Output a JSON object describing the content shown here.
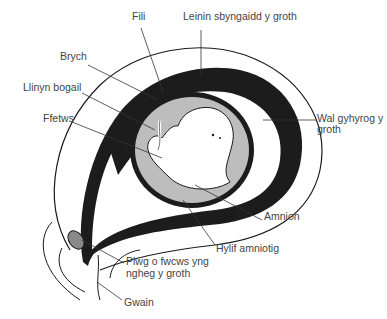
{
  "diagram": {
    "type": "anatomical-illustration",
    "colors": {
      "ink": "#1a1a1a",
      "endometrium": "#1c1c1c",
      "amniotic_fluid": "#bdbdbd",
      "fetus": "#ffffff",
      "label_text": "#444444",
      "background": "#ffffff"
    },
    "labels": {
      "fili": "Fili",
      "leinin": "Leinin sbyngaidd y groth",
      "brych": "Brych",
      "llinyn": "Llinyn bogail",
      "ffetws": "Ffetws",
      "wal_line1": "Wal gyhyrog y",
      "wal_line2": "groth",
      "amnion": "Amnion",
      "hylif": "Hylif amniotig",
      "plwg_line1": "Plwg o fwcws yng",
      "plwg_line2": "ngheg y groth",
      "gwain": "Gwain"
    }
  }
}
